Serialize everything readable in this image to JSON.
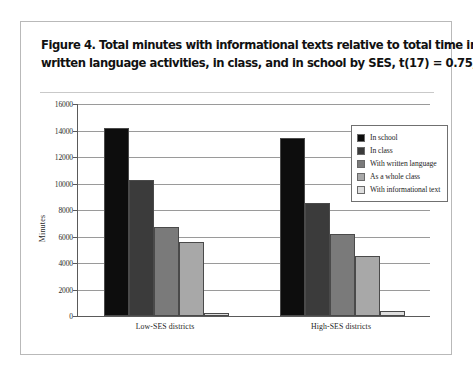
{
  "figure": {
    "caption_line1": "Figure 4.  Total minutes with informational texts relative to total time in",
    "caption_line2": "written language activities, in class, and in school by SES, t(17) = 0.75, ns"
  },
  "chart_data": {
    "type": "bar",
    "title": "Figure 4.  Total minutes with informational texts relative to total time in written language activities, in class, and in school by SES, t(17) = 0.75, ns",
    "xlabel": "",
    "ylabel": "Minutes",
    "ylim": [
      0,
      16000
    ],
    "yticks": [
      0,
      2000,
      4000,
      6000,
      8000,
      10000,
      12000,
      14000,
      16000
    ],
    "ytick_labels": [
      "0",
      "2000",
      "4000",
      "6000",
      "8000",
      "10000",
      "12000",
      "14000",
      "16000"
    ],
    "grid": true,
    "legend_position": "top-right",
    "categories": [
      "Low-SES districts",
      "High-SES districts"
    ],
    "series": [
      {
        "name": "In school",
        "values": [
          14200,
          13400
        ],
        "color": "#0d0d0d"
      },
      {
        "name": "In class",
        "values": [
          10300,
          8500
        ],
        "color": "#3b3b3b"
      },
      {
        "name": "With written language",
        "values": [
          6700,
          6200
        ],
        "color": "#7a7a7a"
      },
      {
        "name": "As a whole class",
        "values": [
          5600,
          4500
        ],
        "color": "#a8a8a8"
      },
      {
        "name": "With informational text",
        "values": [
          250,
          400
        ],
        "color": "#dedede"
      }
    ]
  }
}
